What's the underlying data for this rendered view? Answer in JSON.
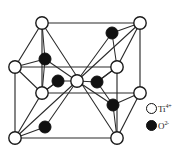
{
  "figure": {
    "background_color": "#ffffff",
    "line_color": "#1a1a1a",
    "cation_fill": "#ffffff",
    "anion_fill": "#111111"
  },
  "legend": {
    "entries": [
      {
        "marker": "open-circle",
        "symbol": "Ti",
        "charge": "4+",
        "label": "Ti4+"
      },
      {
        "marker": "filled-circle",
        "symbol": "O",
        "charge": "2-",
        "label": "O2-"
      }
    ]
  },
  "structure": {
    "cell_type": "tetragonal",
    "cube_vertices": [
      {
        "id": "top-back-left",
        "x": 42,
        "y": 23,
        "species": "Ti"
      },
      {
        "id": "top-back-right",
        "x": 140,
        "y": 23,
        "species": "Ti"
      },
      {
        "id": "top-front-left",
        "x": 15,
        "y": 67,
        "species": "Ti"
      },
      {
        "id": "top-front-right",
        "x": 117,
        "y": 67,
        "species": "Ti"
      },
      {
        "id": "bottom-back-left",
        "x": 42,
        "y": 93,
        "species": "Ti"
      },
      {
        "id": "bottom-back-right",
        "x": 140,
        "y": 93,
        "species": "Ti"
      },
      {
        "id": "bottom-front-left",
        "x": 15,
        "y": 138,
        "species": "Ti"
      },
      {
        "id": "bottom-front-right",
        "x": 117,
        "y": 138,
        "species": "Ti"
      }
    ],
    "body_center_cation": {
      "id": "body-center",
      "x": 77,
      "y": 81,
      "species": "Ti"
    },
    "anions": [
      {
        "id": "o-top-left",
        "x": 45,
        "y": 59,
        "species": "O"
      },
      {
        "id": "o-top-right",
        "x": 112,
        "y": 33,
        "species": "O"
      },
      {
        "id": "o-mid-left",
        "x": 58,
        "y": 81,
        "species": "O"
      },
      {
        "id": "o-mid-right",
        "x": 97,
        "y": 82,
        "species": "O"
      },
      {
        "id": "o-lower-right",
        "x": 113,
        "y": 105,
        "species": "O"
      },
      {
        "id": "o-bottom-left",
        "x": 45,
        "y": 127,
        "species": "O"
      }
    ],
    "counts": {
      "cations_drawn": 9,
      "anions_drawn": 6
    }
  }
}
